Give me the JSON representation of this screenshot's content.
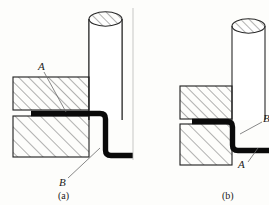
{
  "figure": {
    "background_color": "#fdfdfb",
    "line_color": "#1d1d1d",
    "sheet_color": "#0a0a0a",
    "hatch_color": "#4a4a4a",
    "panels": [
      {
        "id": "a",
        "caption": "(a)",
        "labels": [
          {
            "text": "A",
            "role": "upper-die-contact-callout"
          },
          {
            "text": "B",
            "role": "lower-die-corner-callout"
          }
        ],
        "parts": [
          {
            "name": "punch-cylinder",
            "shape": "cylinder",
            "hatched_top": true
          },
          {
            "name": "upper-die-block",
            "shape": "rectangle",
            "hatch": "fine-45"
          },
          {
            "name": "lower-die-block",
            "shape": "rectangle",
            "hatch": "coarse-45"
          },
          {
            "name": "sheet-metal-blank",
            "shape": "bent-strip",
            "bend": "right-angle-down-then-right"
          }
        ]
      },
      {
        "id": "b",
        "caption": "(b)",
        "labels": [
          {
            "text": "B",
            "role": "bend-radius-callout"
          },
          {
            "text": "A",
            "role": "die-corner-callout"
          }
        ],
        "parts": [
          {
            "name": "punch-cylinder",
            "shape": "cylinder",
            "hatched_top": true
          },
          {
            "name": "upper-die-block",
            "shape": "rectangle",
            "hatch": "fine-45"
          },
          {
            "name": "lower-die-block",
            "shape": "rectangle",
            "hatch": "coarse-45"
          },
          {
            "name": "sheet-metal-blank",
            "shape": "bent-strip",
            "bend": "right-angle-down-then-right"
          }
        ]
      }
    ]
  }
}
